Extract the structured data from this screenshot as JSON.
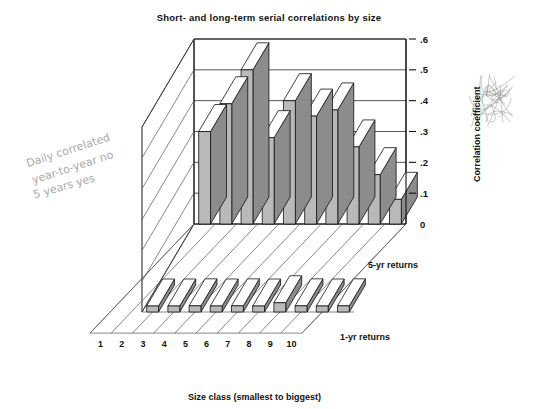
{
  "title": "Short- and long-term serial correlations by size",
  "axis": {
    "y_title": "Correlation coefficient",
    "x_title": "Size class (smallest to biggest)",
    "y_ticks": [
      "0",
      ".1",
      ".2",
      ".3",
      ".4",
      ".5",
      ".6"
    ],
    "x_ticks": [
      "1",
      "2",
      "3",
      "4",
      "5",
      "6",
      "7",
      "8",
      "9",
      "10"
    ]
  },
  "series_labels": {
    "back": "5-yr returns",
    "front": "1-yr returns"
  },
  "annotations": {
    "note_line1": "Daily  correlated",
    "note_line2": "year-to-year  no",
    "note_line3": "5 years  yes",
    "scribble": "scribble-mark"
  },
  "colors": {
    "bar_front": "#b9b9b9",
    "bar_side": "#8c8c8c",
    "bar_top": "#ffffff",
    "outline": "#111111",
    "grid": "#2a2a2a",
    "pencil": "#9a9a9a"
  },
  "chart_data": {
    "type": "bar",
    "title": "Short- and long-term serial correlations by size",
    "xlabel": "Size class (smallest to biggest)",
    "ylabel": "Correlation coefficient",
    "ylim": [
      0,
      0.6
    ],
    "grid": true,
    "legend_position": "right-inline-3d",
    "projection": "3d-two-row",
    "categories": [
      "1",
      "2",
      "3",
      "4",
      "5",
      "6",
      "7",
      "8",
      "9",
      "10"
    ],
    "series": [
      {
        "name": "5-yr returns",
        "values": [
          0.3,
          0.39,
          0.5,
          0.28,
          0.4,
          0.35,
          0.37,
          0.25,
          0.16,
          0.08
        ]
      },
      {
        "name": "1-yr returns",
        "values": [
          0.0,
          0.0,
          0.02,
          0.0,
          0.02,
          0.01,
          0.03,
          0.02,
          0.01,
          0.02
        ]
      }
    ]
  }
}
